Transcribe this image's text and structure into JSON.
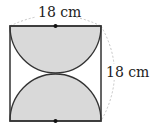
{
  "diagram": {
    "type": "geometry",
    "shape": "square with two semicircles",
    "labels": {
      "top_width": "18 cm",
      "right_height": "18 cm"
    },
    "colors": {
      "shade": "#d9d9d9",
      "stroke": "#333333",
      "dimension_arc": "#bbbbbb"
    }
  }
}
